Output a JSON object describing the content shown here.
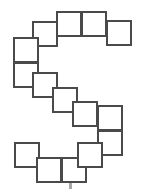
{
  "figure": {
    "canvas": {
      "width": 141,
      "height": 192,
      "background": "#ffffff"
    },
    "style": {
      "tile_fill": "#ffffff",
      "tile_stroke": "#4a4a4a",
      "stroke_width": 2,
      "tile_size": 26
    },
    "tile_count": 14,
    "tiles": [
      {
        "name": "tile-top-center-left",
        "x": 56,
        "y": 11,
        "w": 26,
        "h": 26
      },
      {
        "name": "tile-top-center-right",
        "x": 81,
        "y": 11,
        "w": 26,
        "h": 26
      },
      {
        "name": "tile-top-right",
        "x": 106,
        "y": 20,
        "w": 26,
        "h": 26
      },
      {
        "name": "tile-upper-inner",
        "x": 32,
        "y": 21,
        "w": 26,
        "h": 26
      },
      {
        "name": "tile-left-upper",
        "x": 13,
        "y": 37,
        "w": 26,
        "h": 26
      },
      {
        "name": "tile-left-lower",
        "x": 13,
        "y": 62,
        "w": 26,
        "h": 26
      },
      {
        "name": "tile-diag-1",
        "x": 32,
        "y": 72,
        "w": 26,
        "h": 26
      },
      {
        "name": "tile-diag-2",
        "x": 52,
        "y": 87,
        "w": 26,
        "h": 26
      },
      {
        "name": "tile-diag-3",
        "x": 72,
        "y": 101,
        "w": 26,
        "h": 26
      },
      {
        "name": "tile-right-upper",
        "x": 97,
        "y": 105,
        "w": 26,
        "h": 26
      },
      {
        "name": "tile-right-lower",
        "x": 97,
        "y": 130,
        "w": 26,
        "h": 26
      },
      {
        "name": "tile-bottom-left",
        "x": 14,
        "y": 142,
        "w": 26,
        "h": 26
      },
      {
        "name": "tile-bottom-mid-left",
        "x": 36,
        "y": 157,
        "w": 26,
        "h": 26
      },
      {
        "name": "tile-bottom-mid-right",
        "x": 61,
        "y": 157,
        "w": 26,
        "h": 26
      },
      {
        "name": "tile-bottom-right",
        "x": 77,
        "y": 142,
        "w": 26,
        "h": 26
      }
    ],
    "artifact": {
      "name": "scan-artifact-dot",
      "x": 69,
      "y": 183,
      "w": 3,
      "h": 6
    }
  }
}
